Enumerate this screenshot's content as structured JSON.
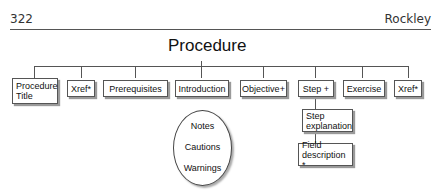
{
  "header": {
    "page_number": "322",
    "running_head": "Rockley"
  },
  "diagram": {
    "title": "Procedure",
    "children": [
      {
        "label": "Procedure Title"
      },
      {
        "label": "Xref*"
      },
      {
        "label": "Prerequisites"
      },
      {
        "label": "Introduction"
      },
      {
        "label": "Objective+"
      },
      {
        "label": "Step +"
      },
      {
        "label": "Exercise"
      },
      {
        "label": "Xref*"
      }
    ],
    "ellipse_items": [
      "Notes",
      "Cautions",
      "Warnings"
    ],
    "step_children": [
      {
        "label": "Step explanation"
      },
      {
        "label": "Field description *"
      }
    ]
  }
}
